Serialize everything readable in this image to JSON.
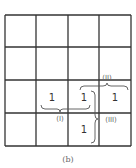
{
  "diagram": {
    "grid": {
      "rows": 4,
      "cols": 4
    },
    "cells": [
      {
        "row": 2,
        "col": 1,
        "value": "1"
      },
      {
        "row": 2,
        "col": 2,
        "value": "1"
      },
      {
        "row": 2,
        "col": 3,
        "value": "1"
      },
      {
        "row": 3,
        "col": 2,
        "value": "1"
      }
    ],
    "groupings": [
      {
        "label": "(I)",
        "cells": [
          [
            2,
            1
          ],
          [
            2,
            2
          ]
        ],
        "position": "below"
      },
      {
        "label": "(II)",
        "cells": [
          [
            2,
            2
          ],
          [
            2,
            3
          ]
        ],
        "position": "above"
      },
      {
        "label": "(III)",
        "cells": [
          [
            2,
            2
          ],
          [
            3,
            2
          ]
        ],
        "position": "right"
      }
    ],
    "caption": "(b)"
  }
}
